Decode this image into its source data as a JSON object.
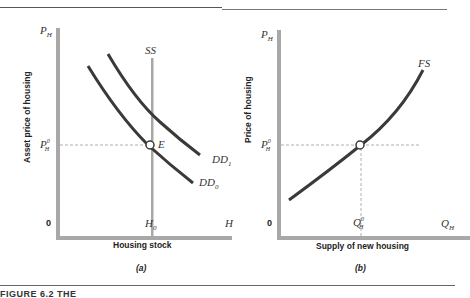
{
  "figure": {
    "caption": "FIGURE 6.2  THE",
    "panel_a": {
      "label": "(a)",
      "y_axis_title": "Asset price of housing",
      "x_axis_title": "Housing stock",
      "y_axis_top": "P",
      "y_axis_top_sub": "H",
      "y_equilibrium": "P",
      "y_equilibrium_sup": "0",
      "y_equilibrium_sub": "H",
      "origin": "0",
      "x_equilibrium": "H",
      "x_equilibrium_sub": "0",
      "x_axis_end": "H",
      "supply_label": "SS",
      "demand0_label": "DD",
      "demand0_sub": "0",
      "demand1_label": "DD",
      "demand1_sub": "1",
      "equilibrium_label": "E"
    },
    "panel_b": {
      "label": "(b)",
      "y_axis_title": "Price of housing",
      "x_axis_title": "Supply of new housing",
      "y_axis_top": "P",
      "y_axis_top_sub": "H",
      "y_equilibrium": "P",
      "y_equilibrium_sup": "0",
      "y_equilibrium_sub": "H",
      "origin": "0",
      "x_equilibrium": "Q",
      "x_equilibrium_sup": "0",
      "x_equilibrium_sub": "H",
      "x_axis_end": "Q",
      "x_axis_end_sub": "H",
      "supply_label": "FS"
    },
    "colors": {
      "axis": "#a8a8a8",
      "curve": "#3a3a3a",
      "dashed": "#b0b0b0"
    }
  }
}
